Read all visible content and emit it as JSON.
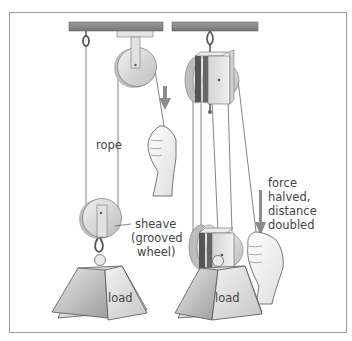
{
  "diagram": {
    "labels": {
      "rope": "rope",
      "sheave_line1": "sheave",
      "sheave_line2": "(grooved",
      "sheave_line3": "wheel)",
      "load_left": "load",
      "load_right": "load",
      "force_line1": "force",
      "force_line2": "halved,",
      "force_line3": "distance",
      "force_line4": "doubled"
    },
    "icons": {
      "pull_arrow_left": "down-arrow",
      "pull_arrow_right": "down-arrow"
    },
    "colors": {
      "beam": "#8a8a8a",
      "frame": "#9a9a9a",
      "metal_light": "#e6e6e6",
      "metal_dark": "#9c9c9c",
      "rope": "#6a6a6a",
      "arrow": "#8c8c8c",
      "text": "#444444"
    }
  }
}
